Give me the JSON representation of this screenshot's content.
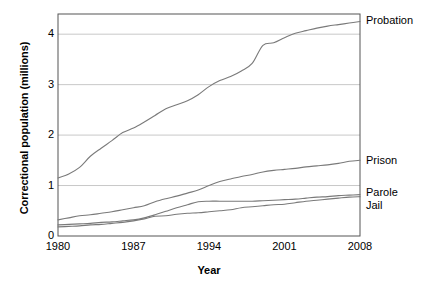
{
  "chart_data": {
    "type": "line",
    "title": "",
    "xlabel": "Year",
    "ylabel": "Correctional population (millions)",
    "xlim": [
      1980,
      2008
    ],
    "ylim": [
      0,
      4.4
    ],
    "xticks": [
      1980,
      1987,
      1994,
      2001,
      2008
    ],
    "xticklabels": [
      "1980",
      "1987",
      "1994",
      "2001",
      "2008"
    ],
    "yticks": [
      0,
      1,
      2,
      3,
      4
    ],
    "yticklabels": [
      "0",
      "1",
      "2",
      "3",
      "4"
    ],
    "grid": "horizontal",
    "legend_position": "right-of-axes-inline",
    "line_color": "#7a7a7a",
    "axis_color": "#555555",
    "grid_color": "#c8c8c8",
    "x": [
      1980,
      1981,
      1982,
      1983,
      1984,
      1985,
      1986,
      1987,
      1988,
      1989,
      1990,
      1991,
      1992,
      1993,
      1994,
      1995,
      1996,
      1997,
      1998,
      1999,
      2000,
      2001,
      2002,
      2003,
      2004,
      2005,
      2006,
      2007,
      2008
    ],
    "series": [
      {
        "name": "Probation",
        "label": "Probation",
        "values": [
          1.15,
          1.23,
          1.36,
          1.58,
          1.74,
          1.89,
          2.05,
          2.14,
          2.26,
          2.39,
          2.52,
          2.6,
          2.68,
          2.8,
          2.96,
          3.08,
          3.16,
          3.27,
          3.42,
          3.78,
          3.83,
          3.93,
          4.02,
          4.07,
          4.12,
          4.16,
          4.19,
          4.22,
          4.25
        ]
      },
      {
        "name": "Prison",
        "label": "Prison",
        "values": [
          0.32,
          0.36,
          0.4,
          0.42,
          0.45,
          0.48,
          0.52,
          0.56,
          0.6,
          0.68,
          0.74,
          0.79,
          0.85,
          0.91,
          1.0,
          1.08,
          1.13,
          1.18,
          1.22,
          1.27,
          1.3,
          1.32,
          1.34,
          1.37,
          1.39,
          1.41,
          1.44,
          1.48,
          1.5
        ]
      },
      {
        "name": "Parole",
        "label": "Parole",
        "values": [
          0.22,
          0.23,
          0.24,
          0.25,
          0.27,
          0.28,
          0.3,
          0.32,
          0.36,
          0.42,
          0.49,
          0.56,
          0.62,
          0.68,
          0.69,
          0.69,
          0.69,
          0.69,
          0.69,
          0.7,
          0.71,
          0.72,
          0.73,
          0.75,
          0.77,
          0.78,
          0.8,
          0.81,
          0.82
        ]
      },
      {
        "name": "Jail",
        "label": "Jail",
        "values": [
          0.18,
          0.19,
          0.2,
          0.22,
          0.23,
          0.25,
          0.27,
          0.3,
          0.34,
          0.39,
          0.4,
          0.43,
          0.45,
          0.46,
          0.48,
          0.5,
          0.52,
          0.56,
          0.58,
          0.6,
          0.62,
          0.63,
          0.66,
          0.69,
          0.71,
          0.73,
          0.75,
          0.77,
          0.78
        ]
      }
    ]
  }
}
